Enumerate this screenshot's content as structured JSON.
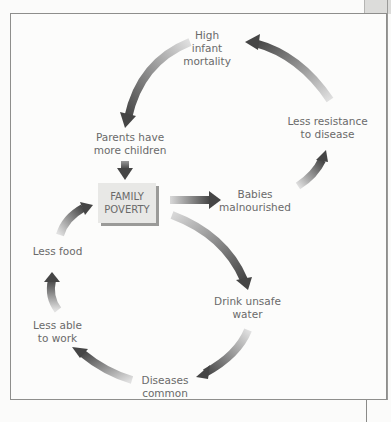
{
  "diagram": {
    "type": "cycle",
    "center": "FAMILY\nPOVERTY",
    "nodes": [
      {
        "id": "mortality",
        "label": "High\ninfant\nmortality"
      },
      {
        "id": "children",
        "label": "Parents have\nmore children"
      },
      {
        "id": "poverty",
        "label": "FAMILY\nPOVERTY"
      },
      {
        "id": "malnourished",
        "label": "Babies\nmalnourished"
      },
      {
        "id": "resistance",
        "label": "Less resistance\nto disease"
      },
      {
        "id": "water",
        "label": "Drink unsafe\nwater"
      },
      {
        "id": "diseases",
        "label": "Diseases\ncommon"
      },
      {
        "id": "work",
        "label": "Less able\nto work"
      },
      {
        "id": "food",
        "label": "Less food"
      }
    ],
    "edges": [
      {
        "from": "mortality",
        "to": "children"
      },
      {
        "from": "children",
        "to": "poverty"
      },
      {
        "from": "poverty",
        "to": "malnourished"
      },
      {
        "from": "malnourished",
        "to": "resistance"
      },
      {
        "from": "resistance",
        "to": "mortality"
      },
      {
        "from": "poverty",
        "to": "water"
      },
      {
        "from": "water",
        "to": "diseases"
      },
      {
        "from": "diseases",
        "to": "work"
      },
      {
        "from": "work",
        "to": "food"
      },
      {
        "from": "food",
        "to": "poverty"
      }
    ],
    "colors": {
      "arrow_dark": "#4a4a4a",
      "arrow_light": "#dcdcdc",
      "text": "#6a6a6a",
      "box": "#e8e8e6"
    }
  }
}
